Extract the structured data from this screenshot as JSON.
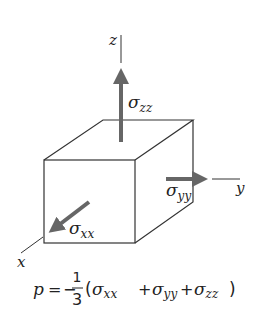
{
  "diagram": {
    "colors": {
      "lines": "#333333",
      "arrows": "#666666",
      "text": "#222222"
    },
    "axes": {
      "z": {
        "label": "z"
      },
      "y": {
        "label": "y"
      },
      "x": {
        "label": "x"
      }
    },
    "stresses": {
      "zz": {
        "symbol": "σ",
        "subscript": "zz"
      },
      "yy": {
        "symbol": "σ",
        "subscript": "yy"
      },
      "xx": {
        "symbol": "σ",
        "subscript": "xx"
      }
    },
    "formula": {
      "lhs": "p",
      "equals": "=",
      "minus": "−",
      "numerator": "1",
      "denominator": "3",
      "open_paren": "(",
      "close_paren": ")",
      "plus": "+",
      "terms": [
        {
          "symbol": "σ",
          "subscript": "xx"
        },
        {
          "symbol": "σ",
          "subscript": "yy"
        },
        {
          "symbol": "σ",
          "subscript": "zz"
        }
      ],
      "text": "p = −(1/3)(σxx + σyy + σzz)"
    }
  }
}
